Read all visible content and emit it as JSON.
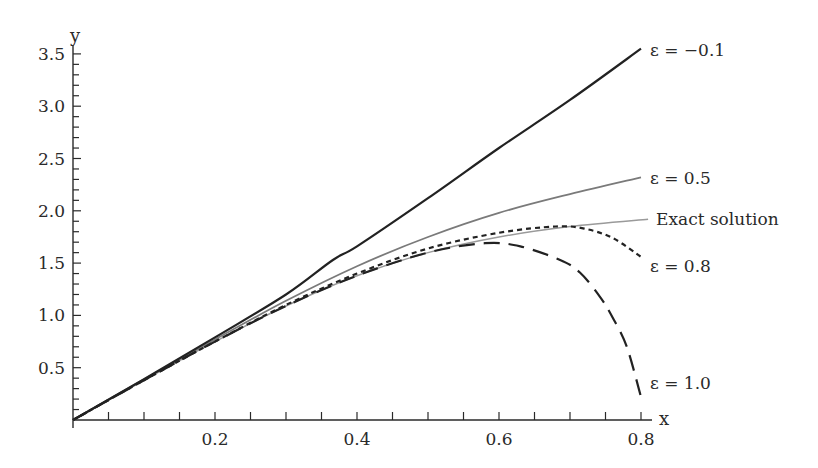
{
  "chart_data": {
    "type": "line",
    "title": "",
    "xlabel": "x",
    "ylabel": "y",
    "xlim": [
      0,
      0.8
    ],
    "ylim": [
      0,
      3.5
    ],
    "grid": false,
    "legend": "inline labels at right end of each curve",
    "x_ticks": [
      {
        "value": 0.2,
        "label": "0.2"
      },
      {
        "value": 0.4,
        "label": "0.4"
      },
      {
        "value": 0.6,
        "label": "0.6"
      },
      {
        "value": 0.8,
        "label": "0.8"
      }
    ],
    "x_minor_step": 0.05,
    "y_ticks": [
      {
        "value": 0.5,
        "label": "0.5"
      },
      {
        "value": 1.0,
        "label": "1.0"
      },
      {
        "value": 1.5,
        "label": "1.5"
      },
      {
        "value": 2.0,
        "label": "2.0"
      },
      {
        "value": 2.5,
        "label": "2.5"
      },
      {
        "value": 3.0,
        "label": "3.0"
      },
      {
        "value": 3.5,
        "label": "3.5"
      }
    ],
    "y_minor_step": 0.1,
    "series": [
      {
        "name": "ε = −0.1",
        "style": "solid",
        "color": "#222222",
        "width": 2.2,
        "x": [
          0,
          0.1,
          0.2,
          0.3,
          0.366,
          0.4,
          0.5,
          0.6,
          0.7,
          0.8
        ],
        "y": [
          0,
          0.39,
          0.79,
          1.2,
          1.53,
          1.66,
          2.12,
          2.6,
          3.06,
          3.55
        ],
        "label_pos": [
          650,
          56
        ]
      },
      {
        "name": "ε = 0.5",
        "style": "solid",
        "color": "#7a7a7a",
        "width": 1.8,
        "x": [
          0,
          0.1,
          0.2,
          0.3,
          0.4,
          0.5,
          0.6,
          0.7,
          0.8
        ],
        "y": [
          0,
          0.39,
          0.77,
          1.14,
          1.47,
          1.75,
          1.98,
          2.16,
          2.32
        ],
        "label_pos": [
          650,
          184
        ]
      },
      {
        "name": "Exact solution",
        "style": "solid",
        "color": "#9a9a9a",
        "width": 1.5,
        "x": [
          0,
          0.1,
          0.2,
          0.3,
          0.4,
          0.5,
          0.6,
          0.7,
          0.81
        ],
        "y": [
          0,
          0.38,
          0.75,
          1.09,
          1.38,
          1.6,
          1.75,
          1.85,
          1.92
        ],
        "label_pos": [
          656,
          225
        ]
      },
      {
        "name": "ε = 0.8",
        "style": "dotted",
        "color": "#222222",
        "width": 2.2,
        "x": [
          0,
          0.1,
          0.2,
          0.3,
          0.4,
          0.5,
          0.6,
          0.68,
          0.72,
          0.76,
          0.8
        ],
        "y": [
          0,
          0.38,
          0.75,
          1.1,
          1.4,
          1.64,
          1.79,
          1.85,
          1.83,
          1.74,
          1.56
        ],
        "label_pos": [
          650,
          272
        ]
      },
      {
        "name": "ε = 1.0",
        "style": "dashed",
        "color": "#222222",
        "width": 2.2,
        "x": [
          0,
          0.1,
          0.2,
          0.3,
          0.4,
          0.5,
          0.58,
          0.63,
          0.686,
          0.714,
          0.742,
          0.76,
          0.78,
          0.8
        ],
        "y": [
          0,
          0.38,
          0.75,
          1.09,
          1.38,
          1.6,
          1.69,
          1.66,
          1.53,
          1.41,
          1.18,
          0.98,
          0.7,
          0.22
        ],
        "label_pos": [
          650,
          389
        ]
      }
    ]
  }
}
